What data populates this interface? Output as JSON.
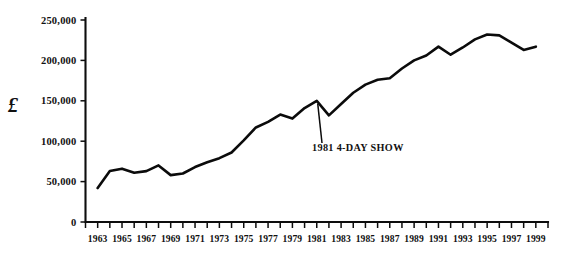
{
  "chart_data": {
    "type": "line",
    "title": "",
    "subtitle": "",
    "xlabel": "",
    "ylabel": "£",
    "ylim": [
      0,
      250000
    ],
    "xlim": [
      1962,
      2000
    ],
    "grid": false,
    "legend": null,
    "y_ticks": [
      0,
      50000,
      100000,
      150000,
      200000,
      250000
    ],
    "y_tick_labels": [
      "0",
      "50,000",
      "100,000",
      "150,000",
      "200,000",
      "250,000"
    ],
    "x_tick_years": [
      1962,
      1963,
      1964,
      1965,
      1966,
      1967,
      1968,
      1969,
      1970,
      1971,
      1972,
      1973,
      1974,
      1975,
      1976,
      1977,
      1978,
      1979,
      1980,
      1981,
      1982,
      1983,
      1984,
      1985,
      1986,
      1987,
      1988,
      1989,
      1990,
      1991,
      1992,
      1993,
      1994,
      1995,
      1996,
      1997,
      1998,
      1999,
      2000
    ],
    "x_tick_labels": [
      "1963",
      "1965",
      "1967",
      "1969",
      "1971",
      "1973",
      "1975",
      "1977",
      "1979",
      "1981",
      "1983",
      "1985",
      "1987",
      "1989",
      "1991",
      "1993",
      "1995",
      "1997",
      "1999"
    ],
    "x_tick_label_years": [
      1963,
      1965,
      1967,
      1969,
      1971,
      1973,
      1975,
      1977,
      1979,
      1981,
      1983,
      1985,
      1987,
      1989,
      1991,
      1993,
      1995,
      1997,
      1999
    ],
    "series": [
      {
        "name": "Receipts",
        "color": "#0b0b0b",
        "x": [
          1963,
          1964,
          1965,
          1966,
          1967,
          1968,
          1969,
          1970,
          1971,
          1972,
          1973,
          1974,
          1975,
          1976,
          1977,
          1978,
          1979,
          1980,
          1981,
          1982,
          1983,
          1984,
          1985,
          1986,
          1987,
          1988,
          1989,
          1990,
          1991,
          1992,
          1993,
          1994,
          1995,
          1996,
          1997,
          1998,
          1999
        ],
        "values": [
          42000,
          63000,
          66000,
          61000,
          63000,
          70000,
          58000,
          60000,
          68000,
          74000,
          79000,
          86000,
          101000,
          117000,
          124000,
          133000,
          128000,
          141000,
          150000,
          132000,
          146000,
          160000,
          170000,
          176000,
          178000,
          190000,
          200000,
          206000,
          217000,
          207000,
          216000,
          226000,
          232000,
          231000,
          222000,
          213000,
          217000
        ]
      }
    ],
    "annotations": [
      {
        "text": "1981 4-DAY SHOW",
        "point_year": 1981,
        "point_value": 150000
      }
    ]
  }
}
